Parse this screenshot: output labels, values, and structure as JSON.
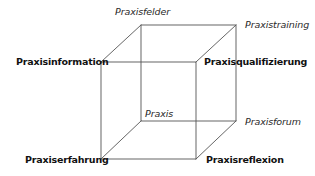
{
  "diagram": {
    "type": "cube",
    "line_color": "#555555",
    "labels": {
      "top_back_center": "Praxisfelder",
      "top_back_right": "Praxistraining",
      "front_top_left": "Praxisinformation",
      "front_top_right": "Praxisqualifizierung",
      "back_bottom_left_inside": "Praxis",
      "back_bottom_right": "Praxisforum",
      "front_bottom_left": "Praxiserfahrung",
      "front_bottom_right": "Praxisreflexion"
    },
    "vertices": {
      "front_top_left": [
        101,
        62
      ],
      "front_top_right": [
        196,
        62
      ],
      "front_bottom_left": [
        101,
        159
      ],
      "front_bottom_right": [
        196,
        159
      ],
      "back_top_left": [
        141,
        25
      ],
      "back_top_right": [
        236,
        25
      ],
      "back_bottom_left": [
        141,
        121
      ],
      "back_bottom_right": [
        236,
        121
      ]
    }
  }
}
